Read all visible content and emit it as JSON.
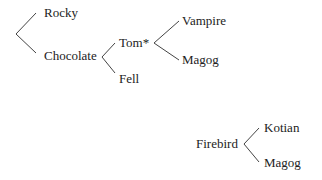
{
  "diagram": {
    "type": "tree",
    "trees": [
      {
        "id": "tree-1",
        "root": {
          "label": "",
          "children": [
            {
              "label": "Rocky",
              "children": []
            },
            {
              "label": "Chocolate",
              "children": [
                {
                  "label": "Tom*",
                  "children": [
                    {
                      "label": "Vampire",
                      "children": []
                    },
                    {
                      "label": "Magog",
                      "children": []
                    }
                  ]
                },
                {
                  "label": "Fell",
                  "children": []
                }
              ]
            }
          ]
        }
      },
      {
        "id": "tree-2",
        "root": {
          "label": "Firebird",
          "children": [
            {
              "label": "Kotian",
              "children": []
            },
            {
              "label": "Magog",
              "children": []
            }
          ]
        }
      }
    ],
    "colors": {
      "text": "#222222",
      "line": "#444444",
      "background": "#ffffff"
    }
  },
  "labels": {
    "rocky": "Rocky",
    "chocolate": "Chocolate",
    "tom": "Tom*",
    "fell": "Fell",
    "vampire": "Vampire",
    "magog_1": "Magog",
    "firebird": "Firebird",
    "kotian": "Kotian",
    "magog_2": "Magog"
  }
}
